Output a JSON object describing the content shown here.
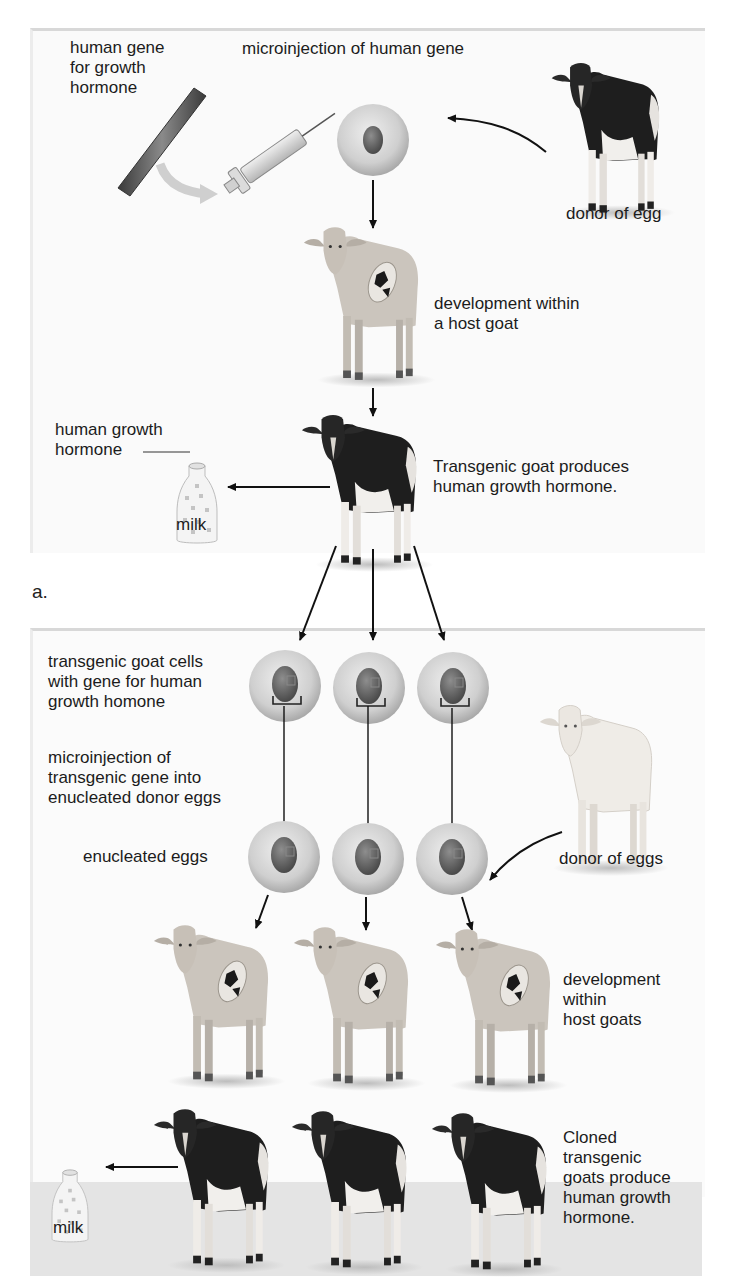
{
  "figure": {
    "panel_a": {
      "part_label": "a.",
      "labels": {
        "human_gene": "human gene\nfor growth\nhormone",
        "microinjection": "microinjection of human gene",
        "donor_of_egg": "donor of egg",
        "development_host": "development within\na host goat",
        "human_growth_hormone": "human growth\nhormone",
        "milk": "milk",
        "transgenic_goat": "Transgenic goat produces\nhuman growth hormone."
      }
    },
    "panel_b": {
      "labels": {
        "transgenic_cells": "transgenic goat cells\nwith gene for human\ngrowth homone",
        "microinjection_transgenic": "microinjection of\ntransgenic gene into\nenucleated donor eggs",
        "enucleated_eggs": "enucleated eggs",
        "donor_of_eggs": "donor of eggs",
        "development_hosts": "development\nwithin\nhost goats",
        "milk": "milk",
        "cloned_goats": "Cloned\ntransgenic\ngoats produce\nhuman growth\nhormone."
      }
    },
    "colors": {
      "black_goat": "#1e1e1e",
      "white_goat_body": "#ece9e4",
      "host_goat": "#c9c3bb",
      "cell": "#c8c8c8",
      "nucleus": "#6a6a6a",
      "arrow": "#111111",
      "bottom_band": "#e4e4e4"
    }
  }
}
